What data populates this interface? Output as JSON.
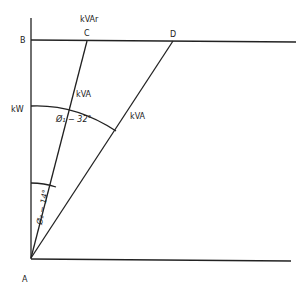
{
  "diagram": {
    "type": "power-triangle",
    "points": {
      "A": {
        "label": "A",
        "x": 31,
        "y": 258
      },
      "B": {
        "label": "B",
        "x": 31,
        "y": 40
      },
      "C": {
        "label": "C",
        "x": 87,
        "y": 40
      },
      "D": {
        "label": "D",
        "x": 173,
        "y": 40
      }
    },
    "axis_labels": {
      "kvar": "kVAr",
      "kw": "kW",
      "kva1": "kVA",
      "kva2": "kVA"
    },
    "angles": {
      "phi1": "Ø₁ − 32°",
      "phi2": "Ø₂ − 14°"
    },
    "colors": {
      "line": "#222222",
      "background": "#ffffff"
    }
  }
}
